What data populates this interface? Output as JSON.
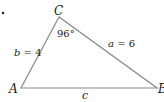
{
  "diagram": {
    "type": "triangle",
    "vertices": {
      "A": {
        "label": "A",
        "x": 21,
        "y": 88
      },
      "B": {
        "label": "B",
        "x": 157,
        "y": 88
      },
      "C": {
        "label": "C",
        "x": 59,
        "y": 17
      }
    },
    "angle_C": "96°",
    "sides": {
      "b": {
        "name": "b",
        "eq": " = ",
        "value": "4"
      },
      "a": {
        "name": "a",
        "eq": " = ",
        "value": "6"
      },
      "c": {
        "name": "c"
      }
    },
    "stroke_color": "#8a8a8a",
    "text_color": "#1a1a1a"
  }
}
